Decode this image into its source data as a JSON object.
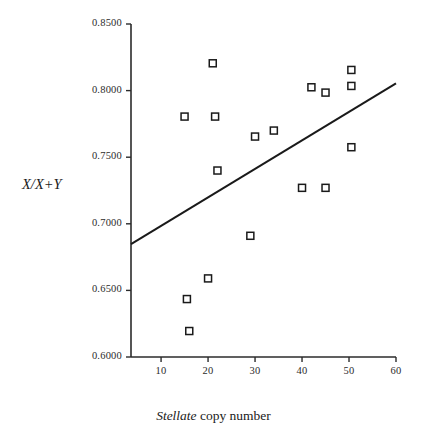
{
  "chart_data": {
    "type": "scatter",
    "title": "",
    "xlabel": "Stellate copy number",
    "xlabel_italic_part": "Stellate",
    "xlabel_roman_part": "copy number",
    "ylabel": "X/X+Y",
    "xlim": [
      3.6,
      60
    ],
    "ylim": [
      0.6,
      0.85
    ],
    "xticks": [
      10,
      20,
      30,
      40,
      50,
      60
    ],
    "yticks": [
      0.6,
      0.65,
      0.7,
      0.75,
      0.8,
      0.85
    ],
    "xtick_labels": [
      "10",
      "20",
      "30",
      "40",
      "50",
      "60"
    ],
    "ytick_labels": [
      "0.6000",
      "0.6500",
      "0.7000",
      "0.7500",
      "0.8000",
      "0.8500"
    ],
    "grid": false,
    "legend": null,
    "marker": "open-square",
    "marker_size_px": 7,
    "marker_edge_color": "#1a1a1a",
    "marker_fill_color": "#ffffff",
    "axis_color": "#2b2b2b",
    "points": [
      {
        "x": 15.0,
        "y": 0.7805
      },
      {
        "x": 15.5,
        "y": 0.6435
      },
      {
        "x": 16.0,
        "y": 0.6195
      },
      {
        "x": 20.0,
        "y": 0.659
      },
      {
        "x": 21.0,
        "y": 0.8205
      },
      {
        "x": 21.5,
        "y": 0.7805
      },
      {
        "x": 22.0,
        "y": 0.74
      },
      {
        "x": 29.0,
        "y": 0.691
      },
      {
        "x": 30.0,
        "y": 0.7655
      },
      {
        "x": 34.0,
        "y": 0.77
      },
      {
        "x": 40.0,
        "y": 0.727
      },
      {
        "x": 42.0,
        "y": 0.8025
      },
      {
        "x": 45.0,
        "y": 0.7985
      },
      {
        "x": 45.0,
        "y": 0.727
      },
      {
        "x": 50.5,
        "y": 0.8155
      },
      {
        "x": 50.5,
        "y": 0.8035
      },
      {
        "x": 50.5,
        "y": 0.7575
      }
    ],
    "trendline": {
      "type": "line",
      "color": "#1a1a1a",
      "width_px": 2,
      "x_start": 3.6,
      "y_start": 0.6848,
      "x_end": 60.0,
      "y_end": 0.8055
    }
  }
}
